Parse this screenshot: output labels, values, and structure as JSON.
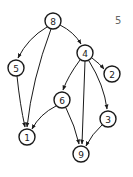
{
  "corner_label": "5",
  "nodes": [
    {
      "id": "8",
      "label": "8",
      "x": 53,
      "y": 21
    },
    {
      "id": "4",
      "label": "4",
      "x": 85,
      "y": 53
    },
    {
      "id": "5",
      "label": "5",
      "x": 16,
      "y": 68
    },
    {
      "id": "2",
      "label": "2",
      "x": 112,
      "y": 74
    },
    {
      "id": "6",
      "label": "6",
      "x": 62,
      "y": 100
    },
    {
      "id": "3",
      "label": "3",
      "x": 108,
      "y": 119
    },
    {
      "id": "1",
      "label": "1",
      "x": 27,
      "y": 137
    },
    {
      "id": "9",
      "label": "9",
      "x": 81,
      "y": 154
    }
  ],
  "edges": [
    {
      "from": "8",
      "to": "5",
      "path": "M47,27 Q28,38 18,58"
    },
    {
      "from": "8",
      "to": "1",
      "path": "M51,29 Q32,80 27,127"
    },
    {
      "from": "8",
      "to": "4",
      "path": "M60,25 Q74,32 81,44"
    },
    {
      "from": "4",
      "to": "2",
      "path": "M92,58 Q100,64 104,69"
    },
    {
      "from": "4",
      "to": "6",
      "path": "M80,60 Q68,76 63,90"
    },
    {
      "from": "4",
      "to": "9",
      "path": "M85,61 L82,144"
    },
    {
      "from": "4",
      "to": "3",
      "path": "M89,61 Q104,85 107,109"
    },
    {
      "from": "5",
      "to": "1",
      "path": "M17,76 Q20,105 25,127"
    },
    {
      "from": "6",
      "to": "1",
      "path": "M56,106 Q40,114 32,129"
    },
    {
      "from": "6",
      "to": "9",
      "path": "M66,108 Q75,126 79,144"
    },
    {
      "from": "3",
      "to": "9",
      "path": "M102,125 Q92,134 86,146"
    }
  ]
}
